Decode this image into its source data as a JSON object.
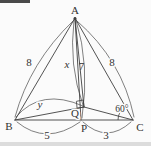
{
  "figure": {
    "type": "geometry-diagram",
    "colors": {
      "stroke": "#3f3f3f",
      "background": "#fbfbfb",
      "top_strip": "#4a4a4a",
      "bottom_band": "#dcdcdc"
    },
    "vertex_labels": {
      "A": "A",
      "B": "B",
      "C": "C",
      "P": "P",
      "Q": "Q"
    },
    "length_labels": {
      "AB": "8",
      "AC": "8",
      "AQ": "x",
      "AP": "7",
      "BQ": "y",
      "BP": "5",
      "PC": "3"
    },
    "angle_labels": {
      "C": "60°"
    },
    "right_angle_at": "Q"
  }
}
